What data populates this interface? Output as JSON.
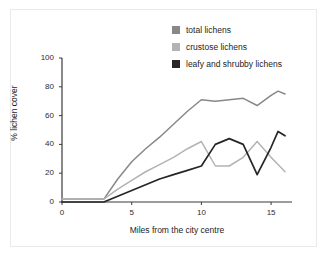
{
  "chart_data": {
    "type": "line",
    "title": "",
    "xlabel": "Miles from the city centre",
    "ylabel": "% lichen cover",
    "xlim": [
      0,
      16.5
    ],
    "ylim": [
      0,
      100
    ],
    "xticks": [
      0,
      5,
      10,
      15
    ],
    "yticks": [
      0,
      20,
      40,
      60,
      80,
      100
    ],
    "grid": false,
    "legend_position": "top-right",
    "x": [
      0,
      1,
      2,
      3,
      4,
      5,
      6,
      7,
      8,
      9,
      10,
      11,
      12,
      13,
      14,
      15,
      15.5,
      16
    ],
    "series": [
      {
        "name": "total lichens",
        "color": "#888888",
        "values": [
          2,
          2,
          2,
          2,
          16,
          28,
          37,
          45,
          54,
          63,
          71,
          70,
          71,
          72,
          67,
          74,
          77,
          75
        ]
      },
      {
        "name": "crustose lichens",
        "color": "#b3b3b3",
        "values": [
          2,
          2,
          2,
          2,
          9,
          15,
          21,
          26,
          31,
          37,
          42,
          25,
          25,
          31,
          42,
          31,
          26,
          21
        ]
      },
      {
        "name": "leafy and shrubby lichens",
        "color": "#262626",
        "values": [
          0,
          0,
          0,
          0,
          4,
          8,
          12,
          16,
          19,
          22,
          25,
          40,
          44,
          40,
          19,
          38,
          49,
          46
        ]
      }
    ],
    "xtick_labels": [
      "0",
      "5",
      "10",
      "15"
    ],
    "ytick_labels": [
      "0",
      "20",
      "40",
      "60",
      "80",
      "100"
    ]
  },
  "legend": {
    "items": [
      {
        "label": "total lichens",
        "color": "#888888"
      },
      {
        "label": "crustose lichens",
        "color": "#b3b3b3"
      },
      {
        "label": "leafy and shrubby lichens",
        "color": "#262626"
      }
    ]
  },
  "axes": {
    "x_axis_label": "Miles from the city centre",
    "y_axis_label": "% lichen cover"
  }
}
